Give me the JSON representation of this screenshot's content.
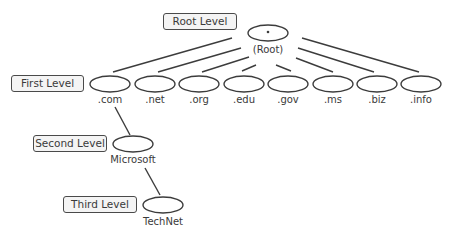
{
  "diagram": {
    "level_labels": [
      {
        "id": "root",
        "text": "Root Level",
        "x": 163,
        "y": 13,
        "w": 74
      },
      {
        "id": "first",
        "text": "First Level",
        "x": 11,
        "y": 75,
        "w": 73
      },
      {
        "id": "second",
        "text": "Second Level",
        "x": 33,
        "y": 135,
        "w": 74
      },
      {
        "id": "third",
        "text": "Third Level",
        "x": 63,
        "y": 196,
        "w": 74
      }
    ],
    "root": {
      "symbol": "•",
      "label": "(Root)",
      "cx": 268,
      "cy": 33
    },
    "first_level": [
      {
        "label": ".com",
        "cx": 110
      },
      {
        "label": ".net",
        "cx": 155
      },
      {
        "label": ".org",
        "cx": 199
      },
      {
        "label": ".edu",
        "cx": 244
      },
      {
        "label": ".gov",
        "cx": 288
      },
      {
        "label": ".ms",
        "cx": 333
      },
      {
        "label": ".biz",
        "cx": 377
      },
      {
        "label": ".info",
        "cx": 421
      }
    ],
    "first_level_cy": 84,
    "second_level": {
      "label": "Microsoft",
      "cx": 133,
      "cy": 144,
      "parent": ".com"
    },
    "third_level": {
      "label": "TechNet",
      "cx": 163,
      "cy": 205,
      "parent": "Microsoft"
    },
    "edges": [
      {
        "from": "root",
        "to": ".com",
        "x1": 232,
        "y1": 38,
        "x2": 113,
        "y2": 72
      },
      {
        "from": "root",
        "to": ".net",
        "x1": 241,
        "y1": 48,
        "x2": 158,
        "y2": 72
      },
      {
        "from": "root",
        "to": ".org",
        "x1": 249,
        "y1": 57,
        "x2": 202,
        "y2": 72
      },
      {
        "from": "root",
        "to": ".edu",
        "x1": 256,
        "y1": 65,
        "x2": 242,
        "y2": 71
      },
      {
        "from": "root",
        "to": ".gov",
        "x1": 276,
        "y1": 65,
        "x2": 291,
        "y2": 71
      },
      {
        "from": "root",
        "to": ".ms",
        "x1": 296,
        "y1": 58,
        "x2": 333,
        "y2": 72
      },
      {
        "from": "root",
        "to": ".biz",
        "x1": 298,
        "y1": 48,
        "x2": 374,
        "y2": 72
      },
      {
        "from": "root",
        "to": ".info",
        "x1": 302,
        "y1": 38,
        "x2": 419,
        "y2": 72
      },
      {
        "from": ".com",
        "to": "Microsoft",
        "x1": 115,
        "y1": 107,
        "x2": 130,
        "y2": 135
      },
      {
        "from": "Microsoft",
        "to": "TechNet",
        "x1": 145,
        "y1": 168,
        "x2": 160,
        "y2": 195
      }
    ],
    "colors": {
      "stroke": "#3c3c3c",
      "box_fill": "#f4f4f4",
      "text": "#3a3a3a",
      "background": "#ffffff"
    }
  }
}
